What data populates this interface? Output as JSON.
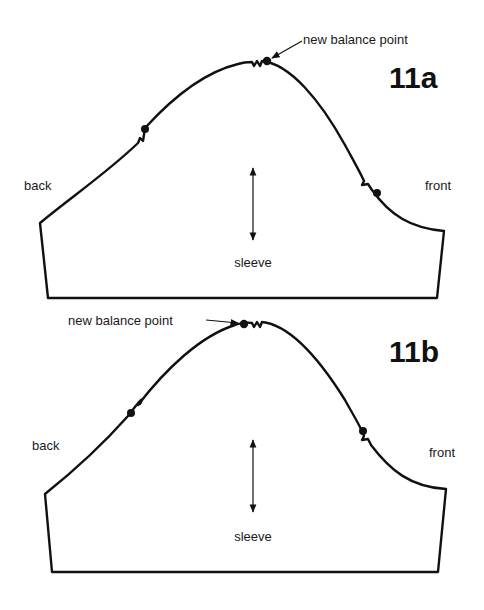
{
  "figures": [
    {
      "id_label": "11a",
      "left_label": "back",
      "right_label": "front",
      "center_label": "sleeve",
      "annotation": "new balance point"
    },
    {
      "id_label": "11b",
      "left_label": "back",
      "right_label": "front",
      "center_label": "sleeve",
      "annotation": "new balance point"
    }
  ],
  "colors": {
    "line": "#111111",
    "background": "#ffffff"
  }
}
